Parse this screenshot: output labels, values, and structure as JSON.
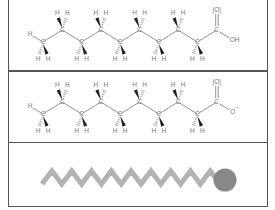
{
  "figure": {
    "panels": [
      {
        "id": "acid",
        "description": "Structural formula of decanoic acid (protonated carboxylic acid)",
        "carbon_count": 10,
        "head_group": {
          "carbonyl_oxygen": "O",
          "hydroxyl": "OH"
        },
        "atom_labels": {
          "carbon": "C",
          "hydrogen": "H"
        }
      },
      {
        "id": "anion",
        "description": "Structural formula of decanoate (deprotonated carboxylate)",
        "carbon_count": 10,
        "head_group": {
          "carbonyl_oxygen": "O",
          "anion_oxygen": "O",
          "charge": "−"
        },
        "atom_labels": {
          "carbon": "C",
          "hydrogen": "H"
        }
      },
      {
        "id": "schematic",
        "description": "Simplified representation: hydrophobic zigzag tail with polar head",
        "tail_color": "#b3b3b3",
        "head_color": "#888888"
      }
    ]
  }
}
